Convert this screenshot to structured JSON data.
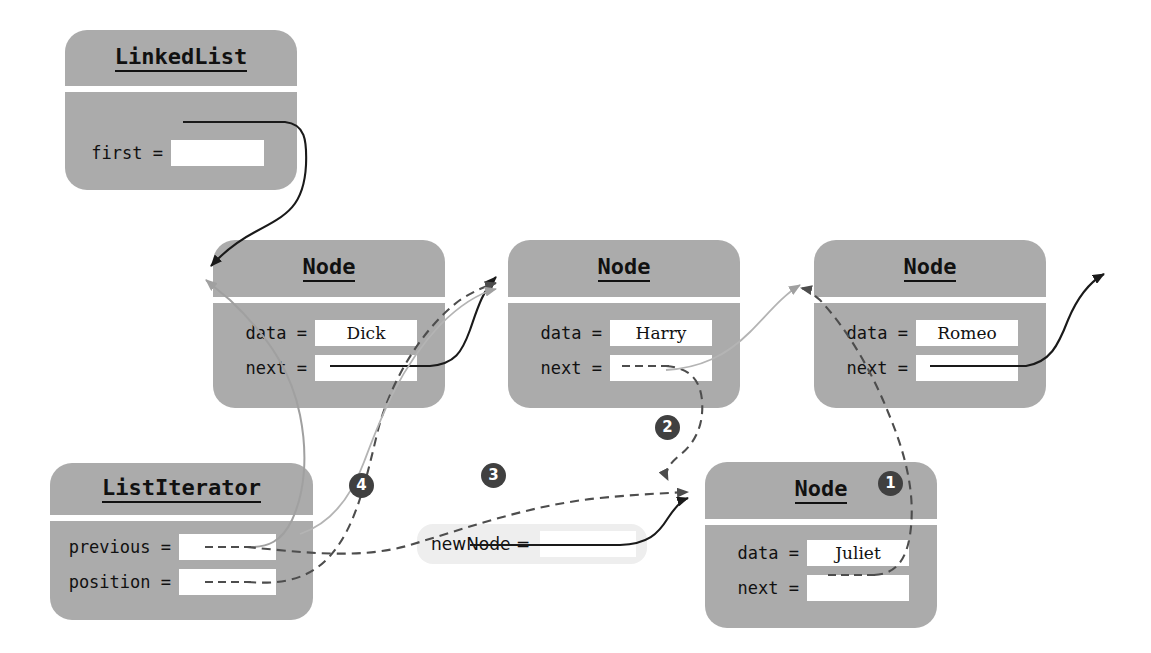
{
  "diagram": {
    "colors": {
      "box_fill": "#ababab",
      "slot_fill": "#ffffff",
      "var_fill": "#eeeeee",
      "badge_fill": "#404040",
      "arrow_solid": "#1a1a1a",
      "arrow_dashed": "#555555",
      "arrow_gray": "#9a9a9a",
      "background": "#ffffff"
    }
  },
  "objects": {
    "linked_list": {
      "class_name": "LinkedList",
      "fields": [
        {
          "label": "first =",
          "value": ""
        }
      ]
    },
    "node_dick": {
      "class_name": "Node",
      "fields": [
        {
          "label": "data =",
          "value": "Dick"
        },
        {
          "label": "next =",
          "value": ""
        }
      ]
    },
    "node_harry": {
      "class_name": "Node",
      "fields": [
        {
          "label": "data =",
          "value": "Harry"
        },
        {
          "label": "next =",
          "value": ""
        }
      ]
    },
    "node_romeo": {
      "class_name": "Node",
      "fields": [
        {
          "label": "data =",
          "value": "Romeo"
        },
        {
          "label": "next =",
          "value": ""
        }
      ]
    },
    "node_juliet": {
      "class_name": "Node",
      "fields": [
        {
          "label": "data =",
          "value": "Juliet"
        },
        {
          "label": "next =",
          "value": ""
        }
      ]
    },
    "list_iterator": {
      "class_name": "ListIterator",
      "fields": [
        {
          "label": "previous =",
          "value": ""
        },
        {
          "label": "position =",
          "value": ""
        }
      ]
    },
    "new_node_variable": {
      "label": "newNode  =",
      "value": ""
    }
  },
  "step_badges": [
    {
      "number": "1"
    },
    {
      "number": "2"
    },
    {
      "number": "3"
    },
    {
      "number": "4"
    }
  ]
}
